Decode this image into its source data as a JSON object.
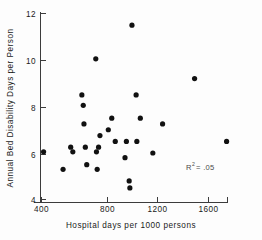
{
  "chart_data": {
    "type": "scatter",
    "title": "",
    "xlabel": "Hospital days per 1000 persons",
    "ylabel": "Annual Bed Disability Days per Person",
    "xlim": [
      330,
      1800
    ],
    "ylim": [
      3.6,
      12.3
    ],
    "xticks": [
      400,
      800,
      1200,
      1600
    ],
    "xticklabels": [
      "400",
      "800",
      "1200",
      "1600"
    ],
    "yticks": [
      4,
      6,
      8,
      10,
      12
    ],
    "yticklabels": [
      "4",
      "6",
      "8",
      "10",
      "12"
    ],
    "grid": false,
    "legend": null,
    "annotations": [
      {
        "name": "r-squared",
        "prefix": "R",
        "superscript": "2",
        "suffix": "= .05",
        "text": "R2 = .05",
        "x": 1330,
        "y": 5.25
      }
    ],
    "marker": {
      "shape": "circle",
      "color": "#111111",
      "size": 2.6
    },
    "points": [
      {
        "x": 415,
        "y": 6.05
      },
      {
        "x": 555,
        "y": 5.3
      },
      {
        "x": 610,
        "y": 6.25
      },
      {
        "x": 625,
        "y": 6.05
      },
      {
        "x": 690,
        "y": 8.5
      },
      {
        "x": 700,
        "y": 8.05
      },
      {
        "x": 705,
        "y": 7.25
      },
      {
        "x": 715,
        "y": 6.25
      },
      {
        "x": 725,
        "y": 5.5
      },
      {
        "x": 790,
        "y": 10.05
      },
      {
        "x": 795,
        "y": 6.05
      },
      {
        "x": 800,
        "y": 5.3
      },
      {
        "x": 810,
        "y": 6.25
      },
      {
        "x": 820,
        "y": 6.75
      },
      {
        "x": 880,
        "y": 7.0
      },
      {
        "x": 905,
        "y": 7.5
      },
      {
        "x": 930,
        "y": 6.5
      },
      {
        "x": 1000,
        "y": 5.8
      },
      {
        "x": 1010,
        "y": 6.5
      },
      {
        "x": 1030,
        "y": 4.8
      },
      {
        "x": 1035,
        "y": 4.5
      },
      {
        "x": 1050,
        "y": 11.5
      },
      {
        "x": 1080,
        "y": 8.5
      },
      {
        "x": 1085,
        "y": 6.5
      },
      {
        "x": 1110,
        "y": 7.5
      },
      {
        "x": 1200,
        "y": 6.0
      },
      {
        "x": 1270,
        "y": 7.25
      },
      {
        "x": 1500,
        "y": 9.2
      },
      {
        "x": 1730,
        "y": 6.5
      }
    ]
  },
  "figure": {
    "axis_color": "#3c3c3c",
    "background": "#fdfdfd"
  }
}
